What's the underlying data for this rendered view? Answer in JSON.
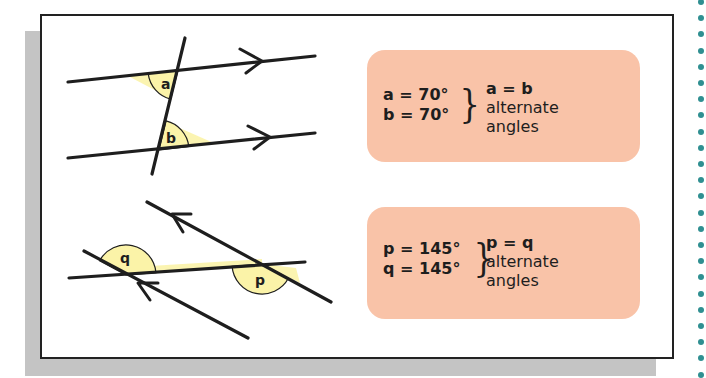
{
  "colors": {
    "box_fill": "#f9c3a8",
    "arc_fill": "#fbf3a8",
    "line": "#1e1e1e",
    "shadow": "#c4c4c4",
    "dots": "#2f8f91"
  },
  "examples": [
    {
      "angle_labels": [
        "a",
        "b"
      ],
      "values": [
        "a = 70°",
        "b = 70°"
      ],
      "rule": {
        "equation": "a = b",
        "line1": "alternate",
        "line2": "angles"
      }
    },
    {
      "angle_labels": [
        "q",
        "p"
      ],
      "values": [
        "p = 145°",
        "q = 145°"
      ],
      "rule": {
        "equation": "p = q",
        "line1": "alternate",
        "line2": "angles"
      }
    }
  ],
  "decor": {
    "right_dots_count": 24,
    "icon": "dotted-border-decoration"
  }
}
